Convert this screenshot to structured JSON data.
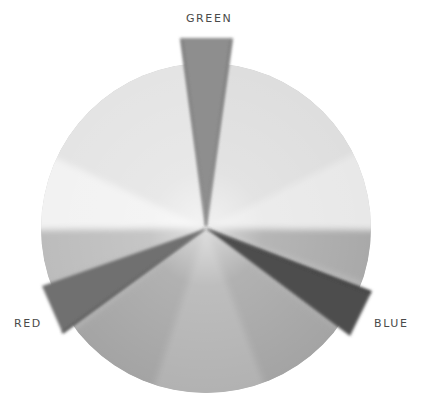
{
  "diagram": {
    "type": "color-wheel",
    "center": [
      206,
      228
    ],
    "radius": 165,
    "wedges": [
      {
        "name": "GREEN",
        "label": "GREEN",
        "position": "top",
        "fill": "#8c8c8c"
      },
      {
        "name": "RED",
        "label": "RED",
        "position": "lower-left",
        "fill": "#6e6e6e"
      },
      {
        "name": "BLUE",
        "label": "BLUE",
        "position": "lower-right",
        "fill": "#4a4a4a"
      }
    ]
  },
  "labels": {
    "green": "GREEN",
    "red": "RED",
    "blue": "BLUE"
  }
}
